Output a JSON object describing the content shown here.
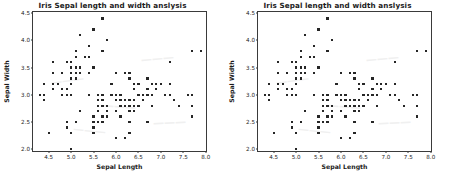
{
  "figure": {
    "panel_count": 2,
    "background_color": "#ffffff",
    "marker_color": "#262626",
    "axis_color": "#3a3a3a"
  },
  "panels": [
    {
      "id": "left-chart",
      "title": "Iris Sepal length and width anslysis"
    },
    {
      "id": "right-chart",
      "title": "Iris Sepal length and width anslysis"
    }
  ],
  "chart_data": {
    "type": "scatter",
    "title": "Iris Sepal length and width anslysis",
    "xlabel": "Sepal Length",
    "ylabel": "Sepal Width",
    "xlim": [
      4.15,
      8.05
    ],
    "ylim": [
      1.93,
      4.52
    ],
    "xticks": [
      "4.5",
      "5.0",
      "5.5",
      "6.0",
      "6.5",
      "7.0",
      "7.5",
      "8.0"
    ],
    "xtick_values": [
      4.5,
      5.0,
      5.5,
      6.0,
      6.5,
      7.0,
      7.5,
      8.0
    ],
    "yticks": [
      "2.0",
      "2.5",
      "3.0",
      "3.5",
      "4.0",
      "4.5"
    ],
    "ytick_values": [
      2.0,
      2.5,
      3.0,
      3.5,
      4.0,
      4.5
    ],
    "grid": false,
    "legend": false,
    "marker": "square",
    "marker_size": 2.2,
    "series": [
      {
        "name": "Iris samples",
        "color": "#262626",
        "x": [
          5.1,
          4.9,
          4.7,
          4.6,
          5.0,
          5.4,
          4.6,
          5.0,
          4.4,
          4.9,
          5.4,
          4.8,
          4.8,
          4.3,
          5.8,
          5.7,
          5.4,
          5.1,
          5.7,
          5.1,
          5.4,
          5.1,
          4.6,
          5.1,
          4.8,
          5.0,
          5.0,
          5.2,
          5.2,
          4.7,
          4.8,
          5.4,
          5.2,
          5.5,
          4.9,
          5.0,
          5.5,
          4.9,
          4.4,
          5.1,
          5.0,
          4.5,
          4.4,
          5.0,
          5.1,
          4.8,
          5.1,
          4.6,
          5.3,
          5.0,
          7.0,
          6.4,
          6.9,
          5.5,
          6.5,
          5.7,
          6.3,
          4.9,
          6.6,
          5.2,
          5.0,
          5.9,
          6.0,
          6.1,
          5.6,
          6.7,
          5.6,
          5.8,
          6.2,
          5.6,
          5.9,
          6.1,
          6.3,
          6.1,
          6.4,
          6.6,
          6.8,
          6.7,
          6.0,
          5.7,
          5.5,
          5.5,
          5.8,
          6.0,
          5.4,
          6.0,
          6.7,
          6.3,
          5.6,
          5.5,
          5.5,
          6.1,
          5.8,
          5.0,
          5.6,
          5.7,
          5.7,
          6.2,
          5.1,
          5.7,
          6.3,
          5.8,
          7.1,
          6.3,
          6.5,
          7.6,
          4.9,
          7.3,
          6.7,
          7.2,
          6.5,
          6.4,
          6.8,
          5.7,
          5.8,
          6.4,
          6.5,
          7.7,
          7.7,
          6.0,
          6.9,
          5.6,
          7.7,
          6.3,
          6.7,
          7.2,
          6.2,
          6.1,
          6.4,
          7.2,
          7.4,
          7.9,
          6.4,
          6.3,
          6.1,
          7.7,
          6.3,
          6.4,
          6.0,
          6.9,
          6.7,
          6.9,
          5.8,
          6.8,
          6.7,
          6.7,
          6.3,
          6.5,
          6.2,
          5.9
        ],
        "y": [
          3.5,
          3.0,
          3.2,
          3.1,
          3.6,
          3.9,
          3.4,
          3.4,
          2.9,
          3.1,
          3.7,
          3.4,
          3.0,
          3.0,
          4.0,
          4.4,
          3.9,
          3.5,
          3.8,
          3.8,
          3.4,
          3.7,
          3.6,
          3.3,
          3.4,
          3.0,
          3.4,
          3.5,
          3.4,
          3.2,
          3.1,
          3.4,
          4.1,
          4.2,
          3.1,
          3.2,
          3.5,
          3.6,
          3.0,
          3.4,
          3.5,
          2.3,
          3.2,
          3.5,
          3.8,
          3.0,
          3.8,
          3.2,
          3.7,
          3.3,
          3.2,
          3.2,
          3.1,
          2.3,
          2.8,
          2.8,
          3.3,
          2.4,
          2.9,
          2.7,
          2.0,
          3.0,
          2.2,
          2.9,
          2.9,
          3.1,
          3.0,
          2.7,
          2.2,
          2.5,
          3.2,
          2.8,
          2.5,
          2.8,
          2.9,
          3.0,
          2.8,
          3.0,
          2.9,
          2.6,
          2.4,
          2.4,
          2.7,
          2.7,
          3.0,
          3.4,
          3.1,
          2.3,
          3.0,
          2.5,
          2.6,
          3.0,
          2.6,
          2.3,
          2.7,
          3.0,
          2.9,
          2.9,
          2.5,
          2.8,
          3.3,
          2.7,
          3.0,
          2.9,
          3.0,
          3.0,
          2.5,
          2.9,
          2.5,
          3.6,
          3.2,
          2.7,
          3.0,
          2.5,
          2.8,
          3.2,
          3.0,
          3.8,
          2.6,
          2.2,
          3.2,
          2.8,
          2.8,
          2.7,
          3.3,
          3.2,
          2.8,
          3.0,
          2.8,
          3.0,
          2.8,
          3.8,
          2.8,
          2.8,
          2.6,
          3.0,
          3.4,
          3.1,
          3.0,
          3.1,
          3.1,
          3.1,
          2.7,
          3.2,
          3.3,
          3.0,
          2.5,
          3.0,
          3.4,
          3.0
        ]
      }
    ]
  }
}
